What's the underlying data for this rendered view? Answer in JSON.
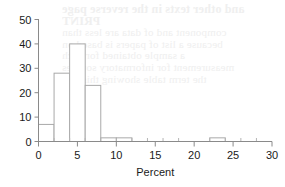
{
  "chart_data": {
    "type": "bar",
    "title": "",
    "subtitle": "",
    "xlabel": "Percent",
    "ylabel": "",
    "xlim": [
      0,
      30
    ],
    "ylim": [
      0,
      50
    ],
    "grid": false,
    "legend": "none",
    "bin_width": 2,
    "categories": [
      "0-2",
      "2-4",
      "4-6",
      "6-8",
      "8-10",
      "10-12",
      "12-14",
      "14-16",
      "16-18",
      "18-20",
      "20-22",
      "22-24",
      "24-26",
      "26-28",
      "28-30"
    ],
    "bin_starts": [
      0,
      2,
      4,
      6,
      8,
      10,
      12,
      14,
      16,
      18,
      20,
      22,
      24,
      26,
      28
    ],
    "values": [
      7,
      28,
      40,
      23,
      1.5,
      1.5,
      0,
      0,
      0,
      0,
      0,
      1.5,
      0,
      0,
      0
    ],
    "x_ticks": [
      0,
      5,
      10,
      15,
      20,
      25,
      30
    ],
    "x_tick_labels": [
      "0",
      "5",
      "10",
      "15",
      "20",
      "25",
      "30"
    ],
    "x_minor_ticks": [
      2,
      4,
      6,
      8,
      12,
      14,
      16,
      18,
      22,
      24,
      26,
      28
    ],
    "y_ticks": [
      0,
      10,
      20,
      30,
      40,
      50
    ],
    "y_tick_labels": [
      "0",
      "10",
      "20",
      "30",
      "40",
      "50"
    ],
    "colors": {
      "bar_fill": "#ffffff",
      "bar_stroke": "#a9a9a9",
      "axis": "#8a8a8a",
      "text": "#1a1a1a",
      "background": "#ffffff",
      "watermark": "#ededed"
    }
  },
  "watermark": {
    "lines": [
      "and other texts in the reverse page",
      "PRINT",
      "component and of data are less than",
      "because a list of papers is based on",
      "a sample obtained for each",
      "measurement for informatory sources",
      "the term table showing this mat"
    ]
  }
}
